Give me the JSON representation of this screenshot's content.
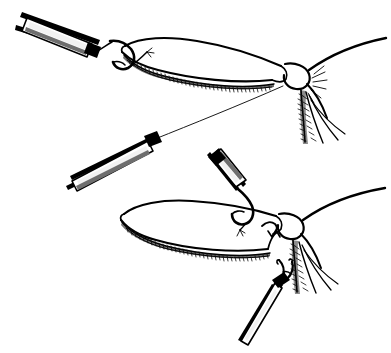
{
  "figure": {
    "medium": "black-and-white line drawing",
    "background_color": "#ffffff",
    "ink_color": "#000000",
    "width": 391,
    "height": 353,
    "panel_count": 2,
    "caption": ""
  },
  "panels": [
    {
      "id": "upper-panel",
      "name": "upper-eyelid-suture-pass",
      "description": "Needle holder at upper left passes a curved needle with suture through the lateral portion of the upper eyelid; the suture runs down and to the left toward a second needle holder.",
      "elements": [
        "needle-holder-upper-left",
        "curved-needle-upper",
        "upper-eyelid-body",
        "upper-eyelash-margin",
        "lateral-canthal-angle-upper",
        "lateral-skin-crease-upper",
        "suture-thread-upper",
        "lower-lid-lashes-upper"
      ]
    },
    {
      "id": "lower-panel",
      "name": "lower-eyelid-suture-retrieval",
      "description": "A second eyelid is shown with a needle holder entering from above carrying the needle, and a toothed forceps at lower right grasping the suture at the lateral canthus.",
      "elements": [
        "needle-holder-lower-middle",
        "curved-needle-lower",
        "lower-eyelid-body",
        "lower-eyelash-margin",
        "lateral-canthal-angle-lower",
        "forceps-lower-right",
        "lower-lid-lashes-lower"
      ]
    }
  ],
  "instruments": [
    {
      "name": "needle-holder-upper-left",
      "label": "Needle holder",
      "position": "upper left",
      "angle_deg": 28,
      "finish": "striped metal shaft with highlight"
    },
    {
      "name": "needle-holder-mid-left",
      "label": "Needle holder",
      "position": "middle left",
      "angle_deg": 28,
      "finish": "striped metal shaft with highlight"
    },
    {
      "name": "needle-holder-lower-middle",
      "label": "Needle holder",
      "position": "lower middle",
      "angle_deg": 65,
      "finish": "striped metal shaft with highlight"
    },
    {
      "name": "forceps-lower-right",
      "label": "Toothed forceps",
      "position": "lower right",
      "angle_deg": 40,
      "finish": "fine two-prong tip"
    }
  ],
  "anatomy": [
    {
      "name": "upper-eyelid-body",
      "label": "Upper eyelid"
    },
    {
      "name": "upper-eyelash-margin",
      "label": "Lash line"
    },
    {
      "name": "lateral-canthal-angle-upper",
      "label": "Lateral canthus"
    },
    {
      "name": "lower-lid-lashes-upper",
      "label": "Lower lid lashes"
    },
    {
      "name": "lower-eyelid-body",
      "label": "Eyelid"
    },
    {
      "name": "lower-eyelash-margin",
      "label": "Lash line"
    },
    {
      "name": "lateral-canthal-angle-lower",
      "label": "Lateral canthus"
    },
    {
      "name": "lower-lid-lashes-lower",
      "label": "Lower lid lashes"
    }
  ],
  "suture": {
    "name": "suture-thread",
    "label": "Suture",
    "stroke_width": 0.9,
    "color": "#000000"
  }
}
